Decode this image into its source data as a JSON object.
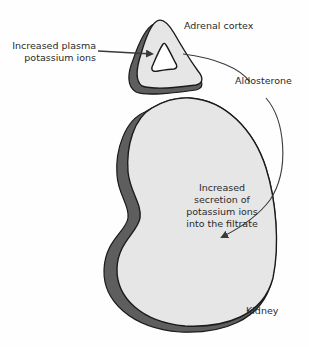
{
  "diagram": {
    "colors": {
      "organ_fill": "#e6e6e6",
      "organ_shadow": "#5e5e5e",
      "outline": "#1a1a1a",
      "arrow": "#3a3a3a",
      "text": "#2a2a2a"
    },
    "labels": {
      "stimulus_line1": "Increased plasma",
      "stimulus_line2": "potassium ions",
      "adrenal": "Adrenal cortex",
      "hormone": "Aldosterone",
      "effect_line1": "Increased",
      "effect_line2": "secretion of",
      "effect_line3": "potassium ions",
      "effect_line4": "into the filtrate",
      "kidney": "Kidney"
    },
    "nodes": [
      {
        "id": "adrenal",
        "label": "Adrenal cortex",
        "shape": "triangular organ"
      },
      {
        "id": "kidney",
        "label": "Kidney",
        "shape": "bean organ"
      }
    ],
    "edges": [
      {
        "from": "Increased plasma potassium ions",
        "to": "adrenal",
        "type": "straight-arrow"
      },
      {
        "from": "adrenal",
        "to": "kidney",
        "label": "Aldosterone",
        "type": "curved-arrow"
      }
    ]
  }
}
